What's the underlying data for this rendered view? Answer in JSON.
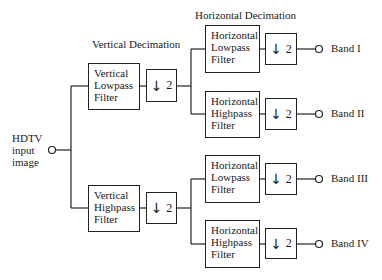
{
  "headings": {
    "vertical": "Vertical Decimation",
    "horizontal": "Horizontal Decimation"
  },
  "input": {
    "lines": [
      "HDTV",
      "input",
      "image"
    ]
  },
  "vertical_filters": [
    {
      "lines": [
        "Vertical",
        "Lowpass",
        "Filter"
      ]
    },
    {
      "lines": [
        "Vertical",
        "Highpass",
        "Filter"
      ]
    }
  ],
  "horizontal_filters": [
    {
      "lines": [
        "Horizontal",
        "Lowpass",
        "Filter"
      ]
    },
    {
      "lines": [
        "Horizontal",
        "Highpass",
        "Filter"
      ]
    },
    {
      "lines": [
        "Horizontal",
        "Lowpass",
        "Filter"
      ]
    },
    {
      "lines": [
        "Horizontal",
        "Highpass",
        "Filter"
      ]
    }
  ],
  "decimator": {
    "arrow": "↓",
    "factor": "2"
  },
  "bands": [
    "Band I",
    "Band II",
    "Band III",
    "Band IV"
  ]
}
